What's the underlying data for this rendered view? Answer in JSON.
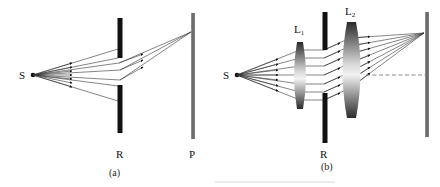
{
  "figure": {
    "panel_a": {
      "caption": "(a)",
      "source_label": "S",
      "barrier_label": "R",
      "screen_label": "P",
      "description": "Point source S emits rays toward barrier R with an aperture; rays passing through converge on screen P"
    },
    "panel_b": {
      "caption": "(b)",
      "source_label": "S",
      "lens1_label": "L",
      "lens1_sub": "1",
      "lens2_label": "L",
      "lens2_sub": "2",
      "barrier_label": "R",
      "description": "Point source S, lens L1 collimates rays, rays pass through aperture in R, lens L2 focuses onto screen; dashed optical axis"
    },
    "bottom_caption_faint": "",
    "colors": {
      "rays": "#333333",
      "barrier": "#111111",
      "screen": "#6e6e6e",
      "lens_dark": "#2a2a2a",
      "lens_light": "#f2f2f2"
    }
  }
}
